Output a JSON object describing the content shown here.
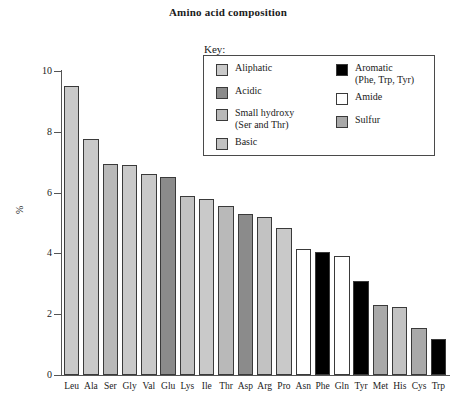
{
  "title": "Amino acid composition",
  "legend": {
    "key_label": "Key:",
    "left_items": [
      {
        "label": "Aliphatic",
        "color": "#c9c9c9"
      },
      {
        "label": "Acidic",
        "color": "#8b8b8b"
      },
      {
        "label": "Small hydroxy\n(Ser and Thr)",
        "color": "#b9b9b9"
      },
      {
        "label": "Basic",
        "color": "#c2c2c2"
      }
    ],
    "right_items": [
      {
        "label": "Aromatic\n(Phe, Trp, Tyr)",
        "color": "#000000"
      },
      {
        "label": "Amide",
        "color": "#ffffff"
      },
      {
        "label": "Sulfur",
        "color": "#a9a9a9"
      }
    ]
  },
  "chart_data": {
    "type": "bar",
    "title": "Amino acid composition",
    "xlabel": "",
    "ylabel": "%",
    "ylim": [
      0,
      10
    ],
    "yticks": [
      0,
      2,
      4,
      6,
      8,
      10
    ],
    "ytick_labels": [
      "0",
      "2",
      "4",
      "6",
      "8",
      "10"
    ],
    "grid": false,
    "legend_position": "upper-center-inside",
    "categories": [
      "Leu",
      "Ala",
      "Ser",
      "Gly",
      "Val",
      "Glu",
      "Lys",
      "Ile",
      "Thr",
      "Asp",
      "Arg",
      "Pro",
      "Asn",
      "Phe",
      "Gln",
      "Tyr",
      "Met",
      "His",
      "Cys",
      "Trp"
    ],
    "values": [
      9.5,
      7.75,
      6.95,
      6.9,
      6.6,
      6.5,
      5.9,
      5.8,
      5.55,
      5.3,
      5.2,
      4.85,
      4.15,
      4.05,
      3.9,
      3.1,
      2.3,
      2.25,
      1.55,
      1.2
    ],
    "bar_groups": [
      "Aliphatic",
      "Aliphatic",
      "Small hydroxy",
      "Aliphatic",
      "Aliphatic",
      "Acidic",
      "Basic",
      "Aliphatic",
      "Small hydroxy",
      "Acidic",
      "Basic",
      "Aliphatic",
      "Amide",
      "Aromatic",
      "Amide",
      "Aromatic",
      "Sulfur",
      "Basic",
      "Sulfur",
      "Aromatic"
    ],
    "bar_colors": [
      "#c9c9c9",
      "#c9c9c9",
      "#b9b9b9",
      "#c9c9c9",
      "#c9c9c9",
      "#8b8b8b",
      "#c2c2c2",
      "#c9c9c9",
      "#b9b9b9",
      "#8b8b8b",
      "#c2c2c2",
      "#c9c9c9",
      "#ffffff",
      "#000000",
      "#ffffff",
      "#000000",
      "#a9a9a9",
      "#c2c2c2",
      "#a9a9a9",
      "#000000"
    ]
  }
}
